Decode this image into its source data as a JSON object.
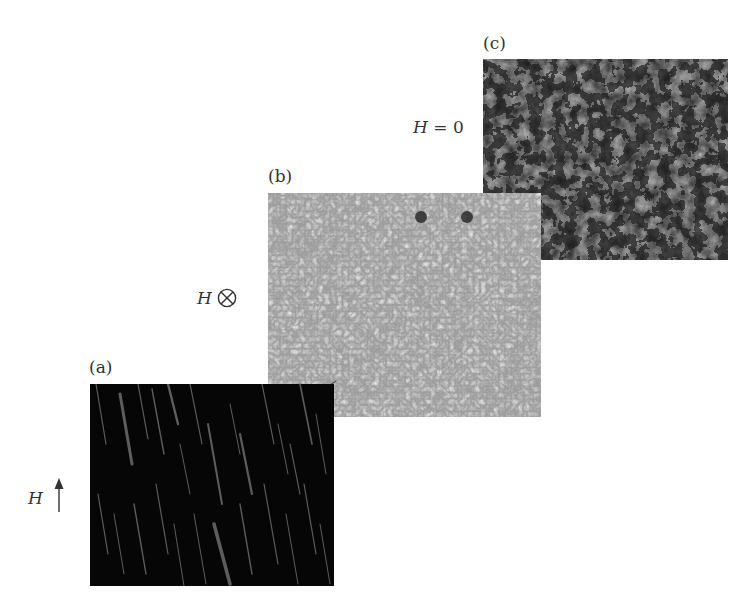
{
  "figure": {
    "panels": [
      {
        "id": "a",
        "label": "(a)",
        "field_symbol": "H",
        "field_direction": "up",
        "field_direction_glyph": "↑",
        "texture": "thin gray diagonal stripe domains on black",
        "colors": {
          "background": "#060606",
          "feature": "#6e6e6e"
        }
      },
      {
        "id": "b",
        "label": "(b)",
        "field_symbol": "H",
        "field_direction": "into-page",
        "field_direction_glyph": "⊗",
        "texture": "light gray labyrinth/bubble domains",
        "colors": {
          "background": "#9a9a9a",
          "feature": "#5a5a5a",
          "highlight": "#c8c8c8"
        }
      },
      {
        "id": "c",
        "label": "(c)",
        "field_symbol": "H",
        "field_relation": "=",
        "field_value": "0",
        "field_text": "H = 0",
        "texture": "dark maze domains with gray patches",
        "colors": {
          "background": "#1a1a1a",
          "feature": "#9c9c9c"
        }
      }
    ]
  }
}
